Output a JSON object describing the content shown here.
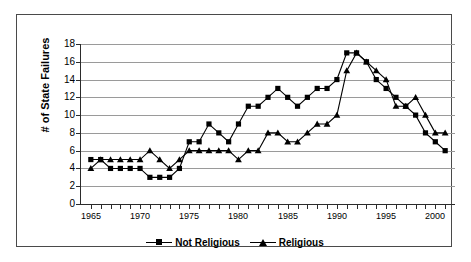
{
  "chart_data": {
    "type": "line",
    "title": "",
    "xlabel": "",
    "ylabel": "# of State Failures",
    "xlim": [
      1964,
      2002
    ],
    "ylim": [
      0,
      18
    ],
    "ytick_step": 2,
    "grid": true,
    "legend_position": "bottom",
    "x": [
      1965,
      1966,
      1967,
      1968,
      1969,
      1970,
      1971,
      1972,
      1973,
      1974,
      1975,
      1976,
      1977,
      1978,
      1979,
      1980,
      1981,
      1982,
      1983,
      1984,
      1985,
      1986,
      1987,
      1988,
      1989,
      1990,
      1991,
      1992,
      1993,
      1994,
      1995,
      1996,
      1997,
      1998,
      1999,
      2000,
      2001
    ],
    "xtick_labels": [
      "1965",
      "1970",
      "1975",
      "1980",
      "1985",
      "1990",
      "1995",
      "2000"
    ],
    "xtick_values": [
      1965,
      1970,
      1975,
      1980,
      1985,
      1990,
      1995,
      2000
    ],
    "ytick_labels": [
      "0",
      "2",
      "4",
      "6",
      "8",
      "10",
      "12",
      "14",
      "16",
      "18"
    ],
    "ytick_values": [
      0,
      2,
      4,
      6,
      8,
      10,
      12,
      14,
      16,
      18
    ],
    "series": [
      {
        "name": "Not Religious",
        "marker": "square",
        "color": "#000000",
        "values": [
          5,
          5,
          4,
          4,
          4,
          4,
          3,
          3,
          3,
          4,
          7,
          7,
          9,
          8,
          7,
          9,
          11,
          11,
          12,
          13,
          12,
          11,
          12,
          13,
          13,
          14,
          17,
          17,
          16,
          14,
          13,
          12,
          11,
          10,
          8,
          7,
          6
        ]
      },
      {
        "name": "Religious",
        "marker": "triangle",
        "color": "#000000",
        "values": [
          4,
          5,
          5,
          5,
          5,
          5,
          6,
          5,
          4,
          5,
          6,
          6,
          6,
          6,
          6,
          5,
          6,
          6,
          8,
          8,
          7,
          7,
          8,
          9,
          9,
          10,
          15,
          17,
          16,
          15,
          14,
          11,
          11,
          12,
          10,
          8,
          8
        ]
      }
    ]
  },
  "legend": {
    "entries": [
      {
        "label": "Not Religious",
        "marker": "square"
      },
      {
        "label": "Religious",
        "marker": "triangle"
      }
    ]
  },
  "axis": {
    "y_title": "# of State Failures"
  }
}
